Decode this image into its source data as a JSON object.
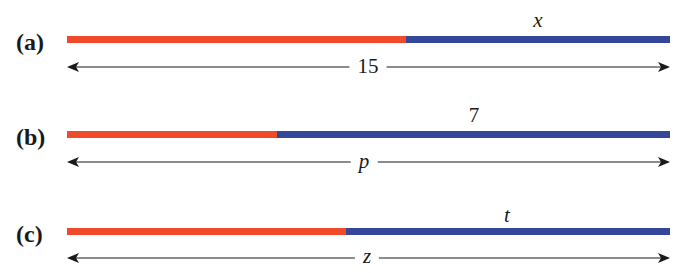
{
  "colors": {
    "known_segment": "#f04a2a",
    "unknown_segment": "#34479a",
    "text": "#1a1a1a"
  },
  "diagrams": [
    {
      "label": "(a)",
      "segment_label": "x",
      "segment_label_italic": true,
      "total_label": "15",
      "total_label_italic": false,
      "red_fraction": 0.563
    },
    {
      "label": "(b)",
      "segment_label": "7",
      "segment_label_italic": false,
      "total_label": "p",
      "total_label_italic": true,
      "red_fraction": 0.348
    },
    {
      "label": "(c)",
      "segment_label": "t",
      "segment_label_italic": true,
      "total_label": "z",
      "total_label_italic": true,
      "red_fraction": 0.463
    }
  ]
}
